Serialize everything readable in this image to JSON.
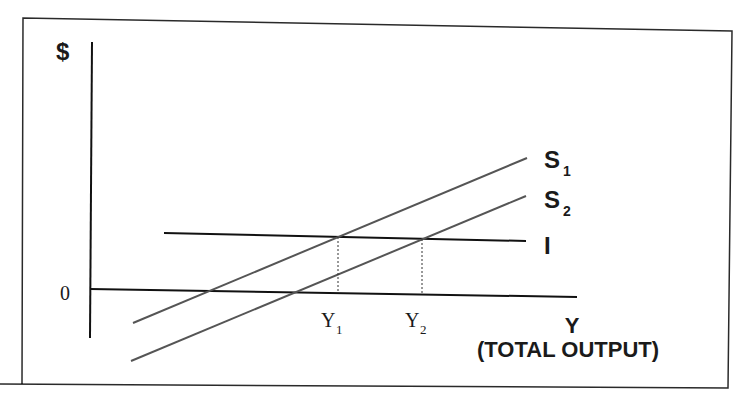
{
  "diagram": {
    "y_axis_label": "$",
    "origin_label": "0",
    "x_axis_label": "Y",
    "x_axis_sublabel": "(TOTAL OUTPUT)",
    "curves": [
      {
        "name": "S",
        "sub": "1",
        "type": "saving-function"
      },
      {
        "name": "S",
        "sub": "2",
        "type": "saving-function"
      },
      {
        "name": "I",
        "sub": "",
        "type": "investment-function"
      }
    ],
    "equilibria": [
      {
        "label": "Y",
        "sub": "1"
      },
      {
        "label": "Y",
        "sub": "2"
      }
    ],
    "colors": {
      "ink": "#1a1a1a",
      "curve": "#555555",
      "background": "#ffffff"
    }
  }
}
